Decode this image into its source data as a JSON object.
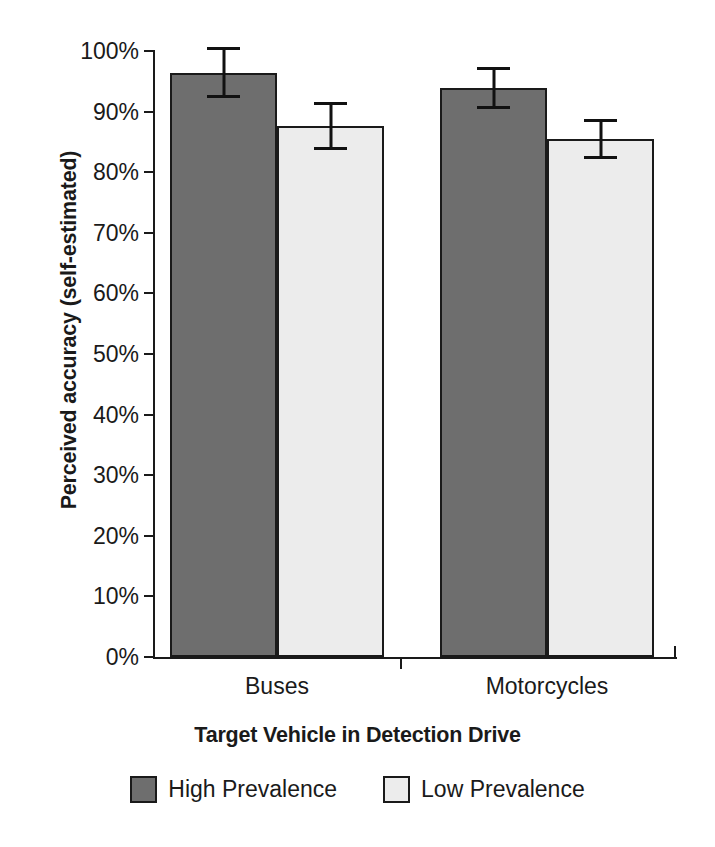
{
  "chart_data": {
    "type": "bar",
    "title": "",
    "xlabel": "Target Vehicle in Detection Drive",
    "ylabel": "Perceived accuracy (self-estimated)",
    "categories": [
      "Buses",
      "Motorcycles"
    ],
    "series": [
      {
        "name": "High Prevalence",
        "color": "#6e6e6e",
        "values": [
          96.4,
          93.9
        ],
        "errors": [
          4.2,
          3.4
        ]
      },
      {
        "name": "Low Prevalence",
        "color": "#ececec",
        "values": [
          87.6,
          85.4
        ],
        "errors": [
          4.0,
          3.3
        ]
      }
    ],
    "ylim": [
      0,
      100
    ],
    "y_tick_values": [
      0,
      10,
      20,
      30,
      40,
      50,
      60,
      70,
      80,
      90,
      100
    ],
    "y_tick_labels": [
      "0%",
      "10%",
      "20%",
      "30%",
      "40%",
      "50%",
      "60%",
      "70%",
      "80%",
      "90%",
      "100%"
    ],
    "grid": false,
    "legend_position": "bottom",
    "error_bar_style": "symmetric-capped"
  },
  "axes": {
    "y_title": "Perceived accuracy (self-estimated)",
    "x_title": "Target Vehicle in Detection Drive",
    "y_ticks": [
      {
        "label": "100%",
        "value": 100
      },
      {
        "label": "90%",
        "value": 90
      },
      {
        "label": "80%",
        "value": 80
      },
      {
        "label": "70%",
        "value": 70
      },
      {
        "label": "60%",
        "value": 60
      },
      {
        "label": "50%",
        "value": 50
      },
      {
        "label": "40%",
        "value": 40
      },
      {
        "label": "30%",
        "value": 30
      },
      {
        "label": "20%",
        "value": 20
      },
      {
        "label": "10%",
        "value": 10
      },
      {
        "label": "0%",
        "value": 0
      }
    ],
    "x_ticks": [
      {
        "label": "Buses"
      },
      {
        "label": "Motorcycles"
      }
    ]
  },
  "legend": {
    "items": [
      {
        "label": "High Prevalence",
        "swatch": "high"
      },
      {
        "label": "Low Prevalence",
        "swatch": "low"
      }
    ]
  },
  "colors": {
    "high_prevalence": "#6e6e6e",
    "low_prevalence": "#ececec",
    "axis": "#1a1a1a",
    "background": "#ffffff"
  },
  "artifact": {
    "cropped_top_text": " "
  }
}
